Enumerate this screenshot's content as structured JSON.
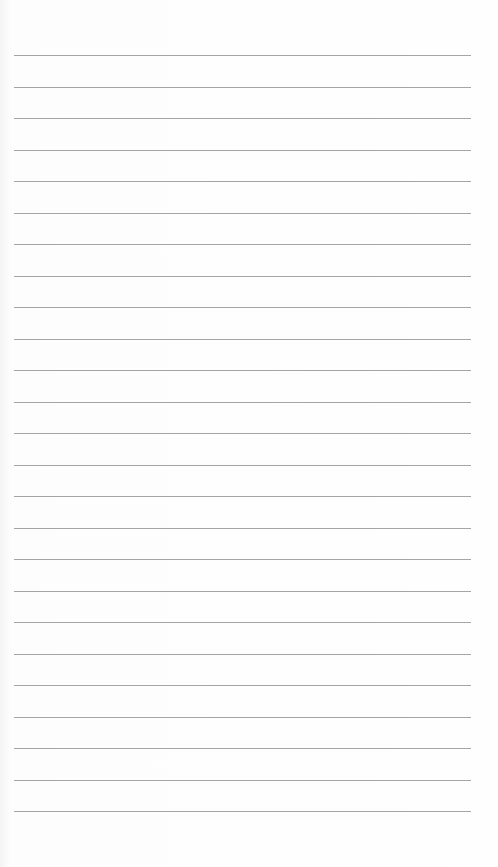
{
  "document": {
    "type": "lined-paper",
    "line_count": 25,
    "line_color": "#8f8f8f",
    "paper_color": "#fdfdfd",
    "text": ""
  }
}
